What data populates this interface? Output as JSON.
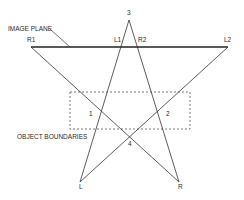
{
  "labels": {
    "image_plane": "IMAGE PLANE",
    "object_boundaries": "OBJECT BOUNDARIES",
    "r1": "R1",
    "l1": "L1",
    "r2": "R2",
    "l2": "L2",
    "apex": "3",
    "region1": "1",
    "region2": "2",
    "region4": "4",
    "left_point": "L",
    "right_point": "R"
  },
  "colors": {
    "line": "#333333",
    "image_plane_line": "#222222",
    "dashed_box": "#555555"
  }
}
